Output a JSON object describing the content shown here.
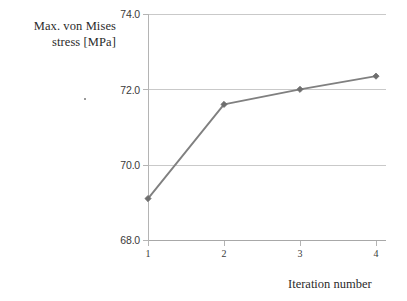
{
  "chart_data": {
    "type": "line",
    "title": "",
    "xlabel": "Iteration number",
    "ylabel": "Max. von Mises stress [MPa]",
    "ylabel_lines": [
      "Max. von Mises",
      "stress [MPa]"
    ],
    "categories": [
      "1",
      "2",
      "3",
      "4"
    ],
    "x": [
      1,
      2,
      3,
      4
    ],
    "values": [
      69.1,
      71.6,
      72.0,
      72.35
    ],
    "series": [
      {
        "name": "Max. von Mises stress",
        "values": [
          69.1,
          71.6,
          72.0,
          72.35
        ]
      }
    ],
    "ylim": [
      68.0,
      74.0
    ],
    "xlim": [
      1,
      4
    ],
    "y_ticks": [
      "68.0",
      "70.0",
      "72.0",
      "74.0"
    ],
    "y_tick_values": [
      68.0,
      70.0,
      72.0,
      74.0
    ],
    "x_ticks": [
      "1",
      "2",
      "3",
      "4"
    ],
    "grid": true,
    "grid_axis": "y",
    "legend": false,
    "legend_position": "none",
    "marker": "diamond",
    "line_color": "#808080",
    "marker_color": "#6e6e6e",
    "grid_color": "#c9c9c9",
    "axis_color": "#b4b4b4",
    "background_color": "#ffffff",
    "text_color": "#2b2b2b"
  }
}
